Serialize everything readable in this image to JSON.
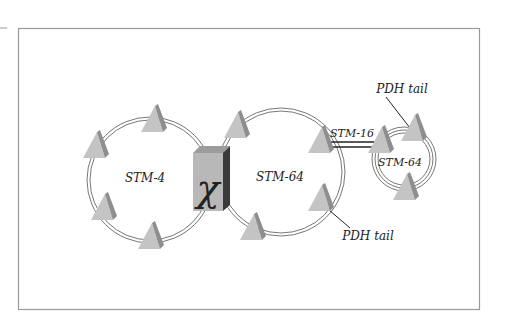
{
  "diagram": {
    "type": "network-topology",
    "colors": {
      "frame": "#9a9a9a",
      "ring": "#777777",
      "node_face": "#c4c4c4",
      "node_side": "#8e8e8e",
      "xc_face": "#b8b8b8",
      "xc_top": "#9c9c9c",
      "xc_side": "#3a3a3a",
      "link": "#222222",
      "text": "#222222"
    },
    "cross_connect": {
      "symbol": "χ",
      "label": "cross-connect"
    },
    "rings": [
      {
        "id": "ring-stm4",
        "label": "STM-4"
      },
      {
        "id": "ring-stm64-main",
        "label": "STM-64"
      },
      {
        "id": "ring-stm64-small",
        "label": "STM-64"
      }
    ],
    "links": [
      {
        "id": "link-stm16",
        "label": "STM-16"
      }
    ],
    "callouts": [
      {
        "id": "pdh-tail-top",
        "label": "PDH tail"
      },
      {
        "id": "pdh-tail-bottom",
        "label": "PDH tail"
      }
    ]
  }
}
